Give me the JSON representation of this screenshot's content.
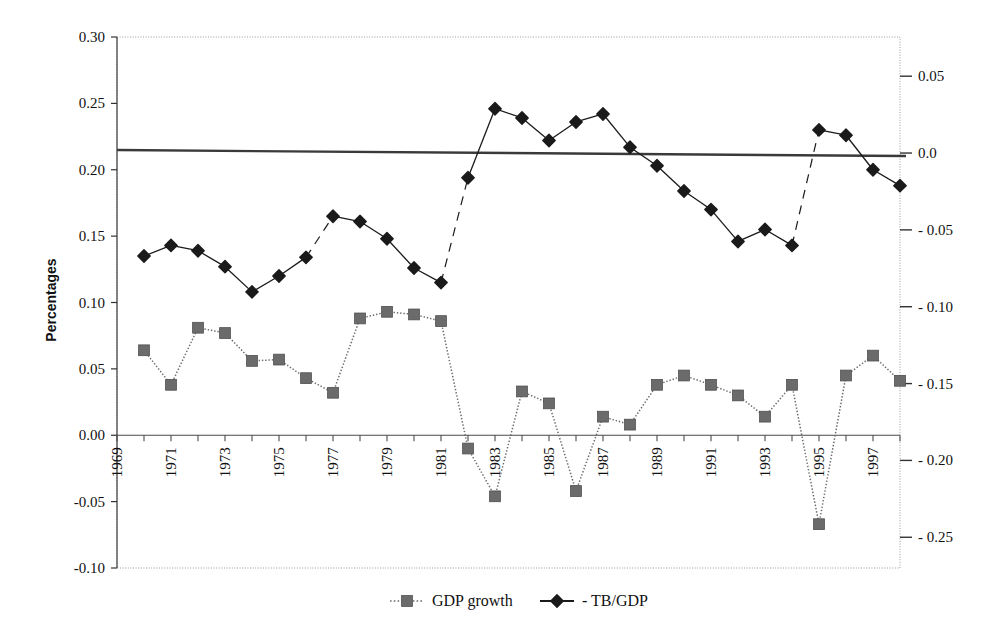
{
  "chart_data": {
    "type": "line",
    "title": "",
    "xlabel": "",
    "ylabel": "Percentages",
    "ylabel_right": "",
    "grid": false,
    "legend_position": "bottom",
    "x": [
      1969,
      1970,
      1971,
      1972,
      1973,
      1974,
      1975,
      1976,
      1977,
      1978,
      1979,
      1980,
      1981,
      1982,
      1983,
      1984,
      1985,
      1986,
      1987,
      1988,
      1989,
      1990,
      1991,
      1992,
      1993,
      1994,
      1995,
      1996,
      1997,
      1998
    ],
    "xtick_labels": [
      "1969",
      "",
      "1971",
      "",
      "1973",
      "",
      "1975",
      "",
      "1977",
      "",
      "1979",
      "",
      "1981",
      "",
      "1983",
      "",
      "1985",
      "",
      "1987",
      "",
      "1989",
      "",
      "1991",
      "",
      "1993",
      "",
      "1995",
      "",
      "1997",
      ""
    ],
    "xlim": [
      1969,
      1998
    ],
    "ylim": [
      -0.1,
      0.3
    ],
    "yticks": [
      0.3,
      0.25,
      0.2,
      0.15,
      0.1,
      0.05,
      0.0,
      -0.05,
      -0.1
    ],
    "ytick_labels": [
      "0.30",
      "0.25",
      "0.20",
      "0.15",
      "0.10",
      "0.05",
      "0.00",
      "-0.05",
      "-0.10"
    ],
    "ylim_right": [
      -0.27,
      0.0755
    ],
    "yticks_right": [
      0.05,
      0.0,
      -0.05,
      -0.1,
      -0.15,
      -0.2,
      -0.25
    ],
    "ytick_labels_right": [
      "0.05",
      "0.0",
      "- 0.05",
      "- 0.10",
      "- 0.15",
      "- 0.20",
      "- 0.25"
    ],
    "reference_line_right_value": 0.0,
    "series": [
      {
        "name": "GDP growth",
        "axis": "left",
        "marker": "square",
        "linestyle": "dotted",
        "color": "#6b6b6b",
        "x": [
          1970,
          1971,
          1972,
          1973,
          1974,
          1975,
          1976,
          1977,
          1978,
          1979,
          1980,
          1981,
          1982,
          1983,
          1984,
          1985,
          1986,
          1987,
          1988,
          1989,
          1990,
          1991,
          1992,
          1993,
          1994,
          1995,
          1996,
          1997,
          1998
        ],
        "values": [
          0.064,
          0.038,
          0.081,
          0.077,
          0.056,
          0.057,
          0.043,
          0.032,
          0.088,
          0.093,
          0.091,
          0.086,
          -0.01,
          -0.046,
          0.033,
          0.024,
          -0.042,
          0.014,
          0.008,
          0.038,
          0.045,
          0.038,
          0.03,
          0.014,
          0.038,
          -0.067,
          0.045,
          0.06,
          0.041
        ]
      },
      {
        "name": "- TB/GDP",
        "axis": "left",
        "marker": "diamond",
        "linestyle": "solid",
        "color": "#1a1a1a",
        "x": [
          1970,
          1971,
          1972,
          1973,
          1974,
          1975,
          1976,
          1977,
          1978,
          1979,
          1980,
          1981,
          1982,
          1983,
          1984,
          1985,
          1986,
          1987,
          1988,
          1989,
          1990,
          1991,
          1992,
          1993,
          1994,
          1995,
          1996,
          1997,
          1998
        ],
        "values": [
          0.135,
          0.143,
          0.139,
          0.127,
          0.108,
          0.12,
          0.134,
          0.165,
          0.161,
          0.148,
          0.126,
          0.115,
          0.194,
          0.246,
          0.239,
          0.222,
          0.236,
          0.242,
          0.217,
          0.203,
          0.184,
          0.17,
          0.146,
          0.155,
          0.143,
          0.23,
          0.226,
          0.2,
          0.188
        ],
        "line_breaks": [
          [
            1976,
            1977
          ],
          [
            1981,
            1982
          ],
          [
            1994,
            1995
          ]
        ]
      }
    ],
    "legend": [
      {
        "label": "GDP growth",
        "marker": "square",
        "linestyle": "dotted",
        "color": "#6b6b6b"
      },
      {
        "label": "- TB/GDP",
        "marker": "diamond",
        "linestyle": "solid",
        "color": "#1a1a1a"
      }
    ]
  },
  "plot": {
    "left": 117,
    "right": 900,
    "top": 37,
    "bottom": 568
  }
}
